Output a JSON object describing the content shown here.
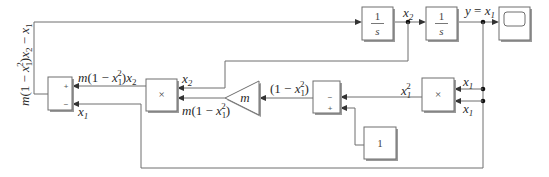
{
  "diagram": {
    "blocks": {
      "integrator1": {
        "numerator": "1",
        "denominator": "s"
      },
      "integrator2": {
        "numerator": "1",
        "denominator": "s"
      },
      "scope": {
        "type": "scope"
      },
      "product_main": {
        "symbol": "×"
      },
      "product_square": {
        "symbol": "×"
      },
      "sum_main": {
        "signs": [
          "+",
          "−"
        ]
      },
      "sum_inner": {
        "signs": [
          "−",
          "+"
        ]
      },
      "gain": {
        "label": "m"
      },
      "constant": {
        "value": "1"
      }
    },
    "signals": {
      "x2": "x2",
      "y_eq_x1": "y = x1",
      "x1_top": "x1",
      "x1_bottom": "x1",
      "x1_squared": "x1²",
      "one_minus_x1sq": "(1 − x1²)",
      "m_one_minus_x1sq": "m(1 − x1²)",
      "x2_into_product": "x2",
      "m_product": "m(1 − x1²)x2",
      "x1_into_sum": "x1",
      "sum_output": "m(1 − x1²)x2 − x1"
    }
  }
}
